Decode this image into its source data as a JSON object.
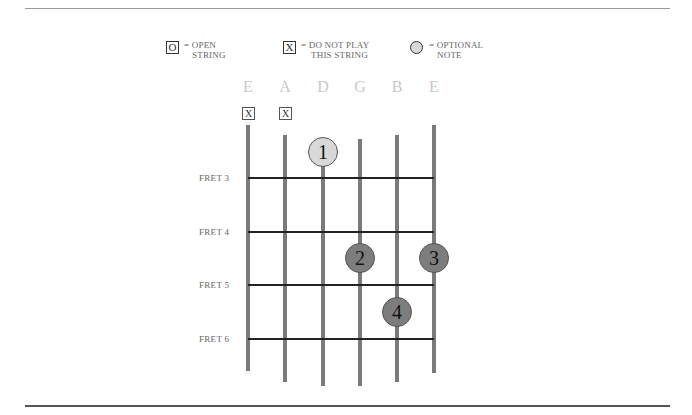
{
  "legend": {
    "open": {
      "symbol": "O",
      "line1": "= OPEN",
      "line2": "STRING"
    },
    "mute": {
      "symbol": "X",
      "line1": "= DO NOT PLAY",
      "line2": "THIS STRING"
    },
    "optional": {
      "symbol": "optional-circle",
      "line1": "= OPTIONAL",
      "line2": "NOTE"
    }
  },
  "strings": [
    {
      "name": "E",
      "x": 248,
      "top": 125,
      "bottom": 371,
      "marker": "X"
    },
    {
      "name": "A",
      "x": 285,
      "top": 135,
      "bottom": 382,
      "marker": "X"
    },
    {
      "name": "D",
      "x": 323,
      "top": 150,
      "bottom": 386,
      "marker": ""
    },
    {
      "name": "G",
      "x": 360,
      "top": 139,
      "bottom": 386,
      "marker": ""
    },
    {
      "name": "B",
      "x": 397,
      "top": 135,
      "bottom": 382,
      "marker": ""
    },
    {
      "name": "E",
      "x": 434,
      "top": 125,
      "bottom": 373,
      "marker": ""
    }
  ],
  "frets": [
    {
      "label": "FRET 3",
      "y": 178
    },
    {
      "label": "FRET 4",
      "y": 232
    },
    {
      "label": "FRET 5",
      "y": 285
    },
    {
      "label": "FRET 6",
      "y": 339
    }
  ],
  "fingers": [
    {
      "number": "1",
      "string": "D",
      "x": 323,
      "y": 152,
      "type": "optional"
    },
    {
      "number": "2",
      "string": "G",
      "x": 360,
      "y": 258,
      "type": "fretted"
    },
    {
      "number": "3",
      "string": "E",
      "x": 434,
      "y": 258,
      "type": "fretted"
    },
    {
      "number": "4",
      "string": "B",
      "x": 397,
      "y": 312,
      "type": "fretted"
    }
  ],
  "colors": {
    "string": "#7a7a7a",
    "fret": "#222222",
    "finger_fretted": "#7d7d7d",
    "finger_optional": "#d8d8d8",
    "string_name": "#c8c8c8"
  }
}
